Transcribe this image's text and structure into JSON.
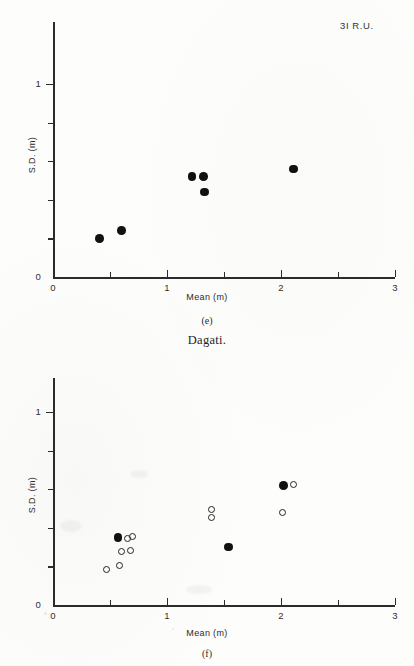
{
  "figure": {
    "group_title": "Dagati.",
    "corner_label": "3I R.U."
  },
  "axes": {
    "x_title": "Mean (m)",
    "y_title": "S.D. (m)",
    "x_labels": [
      "0",
      "1",
      "2",
      "3"
    ],
    "y_labels": [
      "0",
      "1"
    ]
  },
  "panels": [
    {
      "letter": "(e)",
      "label": "3I R.U."
    },
    {
      "letter": "(f)",
      "label": ""
    }
  ],
  "chart_data": [
    {
      "type": "scatter",
      "title": "(e)",
      "subtitle": "3I R.U.",
      "xlabel": "Mean (m)",
      "ylabel": "S.D. (m)",
      "xlim": [
        0,
        3
      ],
      "ylim": [
        0,
        1.22
      ],
      "xticks": [
        0,
        1,
        2,
        3
      ],
      "xticks_minor": [
        0.5,
        1.5,
        2.5
      ],
      "yticks": [
        0,
        1
      ],
      "yticks_minor": [
        0.2,
        0.4,
        0.6,
        0.8
      ],
      "grid": false,
      "legend": false,
      "series": [
        {
          "name": "filled",
          "marker": "filled-circle",
          "points": [
            {
              "x": 0.41,
              "y": 0.2
            },
            {
              "x": 0.6,
              "y": 0.24
            },
            {
              "x": 1.22,
              "y": 0.52
            },
            {
              "x": 1.32,
              "y": 0.52
            },
            {
              "x": 1.33,
              "y": 0.44
            },
            {
              "x": 2.11,
              "y": 0.56
            }
          ]
        }
      ]
    },
    {
      "type": "scatter",
      "title": "(f)",
      "subtitle": "",
      "xlabel": "Mean (m)",
      "ylabel": "S.D. (m)",
      "xlim": [
        0,
        3
      ],
      "ylim": [
        0,
        1.22
      ],
      "xticks": [
        0,
        1,
        2,
        3
      ],
      "xticks_minor": [
        0.5,
        1.5,
        2.5
      ],
      "yticks": [
        0,
        1
      ],
      "yticks_minor": [
        0.2,
        0.4,
        0.6,
        0.8
      ],
      "grid": false,
      "legend": false,
      "series": [
        {
          "name": "filled",
          "marker": "filled-circle",
          "points": [
            {
              "x": 0.57,
              "y": 0.35
            },
            {
              "x": 1.54,
              "y": 0.3
            },
            {
              "x": 2.02,
              "y": 0.62
            }
          ]
        },
        {
          "name": "open",
          "marker": "open-circle",
          "points": [
            {
              "x": 0.65,
              "y": 0.345
            },
            {
              "x": 0.7,
              "y": 0.355
            },
            {
              "x": 0.6,
              "y": 0.275
            },
            {
              "x": 0.68,
              "y": 0.283
            },
            {
              "x": 0.58,
              "y": 0.207
            },
            {
              "x": 0.47,
              "y": 0.183
            },
            {
              "x": 1.39,
              "y": 0.495
            },
            {
              "x": 1.39,
              "y": 0.455
            },
            {
              "x": 2.11,
              "y": 0.625
            },
            {
              "x": 2.01,
              "y": 0.48
            }
          ]
        }
      ]
    }
  ]
}
